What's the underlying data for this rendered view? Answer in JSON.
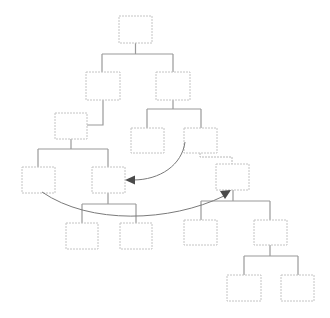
{
  "diagram": {
    "type": "tree",
    "colors": {
      "node_border": "#c4c4c4",
      "edge": "#9a9a9a",
      "curve": "#7a7a7a",
      "arrowhead": "#4a4a4a",
      "background": "#ffffff"
    },
    "nodes": [
      {
        "id": "n1",
        "x": 119,
        "y": 16,
        "w": 33,
        "h": 27,
        "label": ""
      },
      {
        "id": "n2",
        "x": 86,
        "y": 72,
        "w": 34,
        "h": 28,
        "label": ""
      },
      {
        "id": "n3",
        "x": 156,
        "y": 72,
        "w": 34,
        "h": 28,
        "label": ""
      },
      {
        "id": "n4",
        "x": 55,
        "y": 113,
        "w": 32,
        "h": 26,
        "label": ""
      },
      {
        "id": "n5",
        "x": 131,
        "y": 128,
        "w": 33,
        "h": 25,
        "label": ""
      },
      {
        "id": "n6",
        "x": 184,
        "y": 128,
        "w": 33,
        "h": 25,
        "label": ""
      },
      {
        "id": "n7",
        "x": 22,
        "y": 167,
        "w": 33,
        "h": 26,
        "label": ""
      },
      {
        "id": "n8",
        "x": 92,
        "y": 167,
        "w": 33,
        "h": 26,
        "label": ""
      },
      {
        "id": "n9",
        "x": 216,
        "y": 164,
        "w": 33,
        "h": 26,
        "label": ""
      },
      {
        "id": "n10",
        "x": 66,
        "y": 223,
        "w": 32,
        "h": 26,
        "label": ""
      },
      {
        "id": "n11",
        "x": 120,
        "y": 223,
        "w": 32,
        "h": 26,
        "label": ""
      },
      {
        "id": "n12",
        "x": 184,
        "y": 220,
        "w": 33,
        "h": 25,
        "label": ""
      },
      {
        "id": "n13",
        "x": 254,
        "y": 220,
        "w": 33,
        "h": 25,
        "label": ""
      },
      {
        "id": "n14",
        "x": 227,
        "y": 275,
        "w": 34,
        "h": 26,
        "label": ""
      },
      {
        "id": "n15",
        "x": 281,
        "y": 275,
        "w": 33,
        "h": 26,
        "label": ""
      }
    ],
    "edges": [
      {
        "from": "n1",
        "to": [
          "n2",
          "n3"
        ],
        "style": "solid"
      },
      {
        "from": "n2",
        "to": [
          "n4"
        ],
        "style": "solid"
      },
      {
        "from": "n3",
        "to": [
          "n5",
          "n6"
        ],
        "style": "solid"
      },
      {
        "from": "n4",
        "to": [
          "n7",
          "n8"
        ],
        "style": "solid"
      },
      {
        "from": "n6",
        "to": [
          "n9"
        ],
        "style": "dashed"
      },
      {
        "from": "n8",
        "to": [
          "n10",
          "n11"
        ],
        "style": "solid"
      },
      {
        "from": "n9",
        "to": [
          "n12",
          "n13"
        ],
        "style": "solid"
      },
      {
        "from": "n13",
        "to": [
          "n14",
          "n15"
        ],
        "style": "solid"
      }
    ],
    "arrows": [
      {
        "id": "move-arrow-1",
        "from": "n6",
        "to": "n8",
        "shape": "curved"
      },
      {
        "id": "move-arrow-2",
        "from": "n7",
        "to": "n9",
        "shape": "curved"
      }
    ]
  }
}
